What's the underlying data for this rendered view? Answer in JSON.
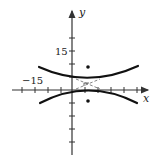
{
  "diagram": {
    "type": "hyperbola-graph",
    "axes": {
      "x_label": "x",
      "y_label": "y",
      "tick_unit": 5,
      "labels": {
        "y_tick": "15",
        "x_tick": "−15"
      }
    },
    "hyperbola": {
      "orientation": "vertical",
      "center": [
        6.5,
        2
      ],
      "vertices": [
        [
          6.5,
          4.2
        ],
        [
          6.5,
          0.8
        ]
      ],
      "foci": [
        [
          6.5,
          8.5
        ],
        [
          6.5,
          -4.3
        ]
      ],
      "asymptotes": "dashed"
    },
    "colors": {
      "curve": "#111111",
      "axis": "#333333",
      "asymptote": "#666666"
    }
  }
}
